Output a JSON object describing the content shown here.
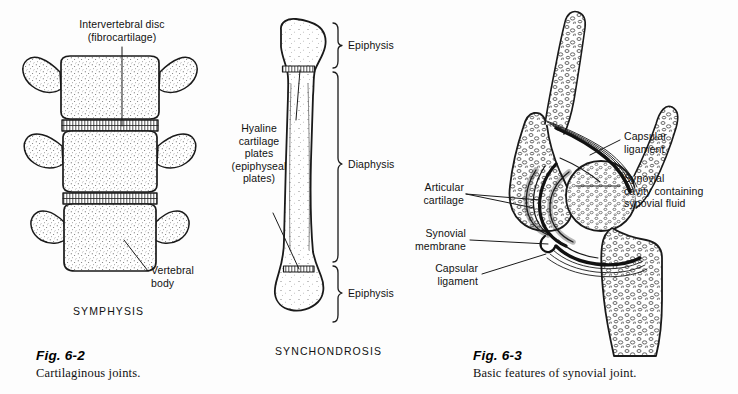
{
  "page": {
    "background": "#fdfdfd",
    "ink": "#111111"
  },
  "figures": [
    {
      "id": "fig-6-2",
      "number": "Fig. 6-2",
      "caption": "Cartilaginous joints.",
      "subtitle": "SYMPHYSIS",
      "labels": [
        {
          "name": "intervertebral-disc",
          "text": "Intervertebral disc\n(fibrocartilage)"
        },
        {
          "name": "vertebral-body",
          "text": "Vertebral\nbody"
        }
      ]
    },
    {
      "id": "fig-synchondrosis",
      "subtitle": "SYNCHONDROSIS",
      "labels": [
        {
          "name": "hyaline-cartilage-plates",
          "text": "Hyaline\ncartilage\nplates\n(epiphyseal\nplates)"
        },
        {
          "name": "epiphysis-upper",
          "text": "Epiphysis"
        },
        {
          "name": "diaphysis",
          "text": "Diaphysis"
        },
        {
          "name": "epiphysis-lower",
          "text": "Epiphysis"
        }
      ]
    },
    {
      "id": "fig-6-3",
      "number": "Fig. 6-3",
      "caption": "Basic features of synovial joint.",
      "labels": [
        {
          "name": "capsular-ligament-upper",
          "text": "Capsular\nligament"
        },
        {
          "name": "synovial-cavity",
          "text": "Synovial\ncavity containing\nsynovial fluid"
        },
        {
          "name": "articular-cartilage",
          "text": "Articular\ncartilage"
        },
        {
          "name": "synovial-membrane",
          "text": "Synovial\nmembrane"
        },
        {
          "name": "capsular-ligament-lower",
          "text": "Capsular\nligament"
        }
      ]
    }
  ],
  "text": {
    "intervertebral_disc": "Intervertebral disc\n(fibrocartilage)",
    "vertebral_body": "Vertebral\nbody",
    "symphysis": "SYMPHYSIS",
    "hyaline_plates": "Hyaline\ncartilage\nplates\n(epiphyseal\nplates)",
    "epiphysis_upper": "Epiphysis",
    "diaphysis": "Diaphysis",
    "epiphysis_lower": "Epiphysis",
    "synchondrosis": "SYNCHONDROSIS",
    "capsular_ligament_upper": "Capsular\nligament",
    "synovial_cavity": "Synovial\ncavity containing\nsynovial fluid",
    "articular_cartilage": "Articular\ncartilage",
    "synovial_membrane": "Synovial\nmembrane",
    "capsular_ligament_lower": "Capsular\nligament",
    "fig_6_2_number": "Fig. 6-2",
    "fig_6_2_caption": "Cartilaginous joints.",
    "fig_6_3_number": "Fig. 6-3",
    "fig_6_3_caption": "Basic features of synovial joint."
  }
}
